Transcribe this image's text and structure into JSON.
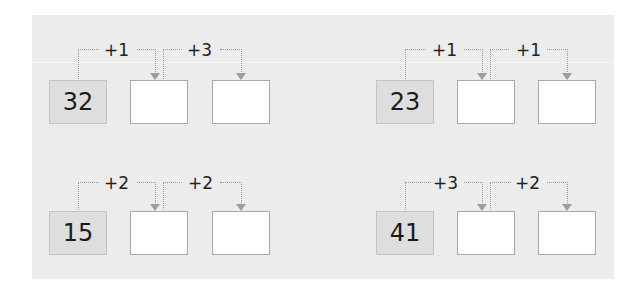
{
  "exercises": [
    {
      "start": "32",
      "steps": [
        "+1",
        "+3"
      ]
    },
    {
      "start": "23",
      "steps": [
        "+1",
        "+1"
      ]
    },
    {
      "start": "15",
      "steps": [
        "+2",
        "+2"
      ]
    },
    {
      "start": "41",
      "steps": [
        "+3",
        "+2"
      ]
    }
  ],
  "colors": {
    "panel": "#ececec",
    "start_box": "#dedede",
    "answer_box": "#ffffff",
    "connector": "#9d9d9d"
  }
}
